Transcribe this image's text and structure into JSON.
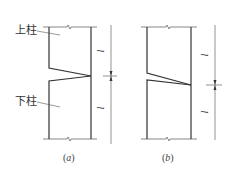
{
  "figure": {
    "panels": [
      {
        "id": "a",
        "caption_open": "(",
        "caption_letter": "a",
        "caption_close": ")",
        "labels": {
          "upper_column": "上柱",
          "lower_column": "下柱"
        },
        "dimensions": {
          "upper_length": "l",
          "lower_length": "l"
        }
      },
      {
        "id": "b",
        "caption_open": "(",
        "caption_letter": "b",
        "caption_close": ")",
        "dimensions": {
          "upper_length": "l",
          "lower_length": "l"
        }
      }
    ],
    "colors": {
      "line": "#333333",
      "thin_line": "#666666"
    }
  }
}
